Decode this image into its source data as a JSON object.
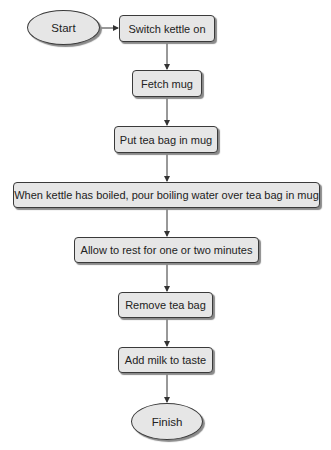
{
  "diagram": {
    "type": "flowchart",
    "nodes": [
      {
        "id": "start",
        "shape": "ellipse",
        "label": "Start"
      },
      {
        "id": "s1",
        "shape": "rounded-rect",
        "label": "Switch kettle on"
      },
      {
        "id": "s2",
        "shape": "rounded-rect",
        "label": "Fetch mug"
      },
      {
        "id": "s3",
        "shape": "rounded-rect",
        "label": "Put tea bag in mug"
      },
      {
        "id": "s4",
        "shape": "rounded-rect",
        "label": "When kettle has boiled, pour boiling water over tea bag in mug"
      },
      {
        "id": "s5",
        "shape": "rounded-rect",
        "label": "Allow to rest for one or two minutes"
      },
      {
        "id": "s6",
        "shape": "rounded-rect",
        "label": "Remove tea bag"
      },
      {
        "id": "s7",
        "shape": "rounded-rect",
        "label": "Add milk to taste"
      },
      {
        "id": "finish",
        "shape": "ellipse",
        "label": "Finish"
      }
    ],
    "edges": [
      [
        "start",
        "s1"
      ],
      [
        "s1",
        "s2"
      ],
      [
        "s2",
        "s3"
      ],
      [
        "s3",
        "s4"
      ],
      [
        "s4",
        "s5"
      ],
      [
        "s5",
        "s6"
      ],
      [
        "s6",
        "s7"
      ],
      [
        "s7",
        "finish"
      ]
    ],
    "colors": {
      "fill": "#e6e6e6",
      "stroke": "#3a3a3a",
      "shadow": "#8a8a8a"
    }
  }
}
